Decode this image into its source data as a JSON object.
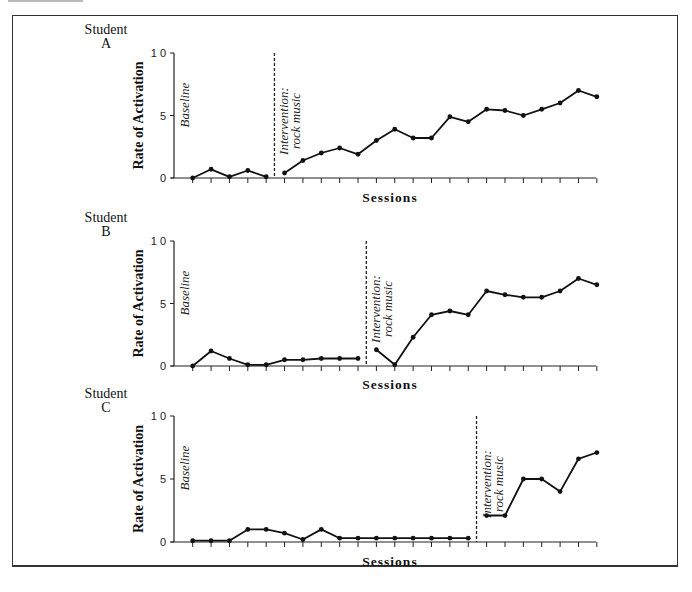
{
  "figure": {
    "x_axis_label": "Sessions",
    "y_axis_label": "Rate of Activation",
    "y_ticks": [
      "0",
      "5",
      "1 0"
    ],
    "phase_baseline": "Baseline",
    "phase_intervention_line1": "Intervention:",
    "phase_intervention_line2": "rock music"
  },
  "panels": [
    {
      "student_word": "Student",
      "student_id": "A"
    },
    {
      "student_word": "Student",
      "student_id": "B"
    },
    {
      "student_word": "Student",
      "student_id": "C"
    }
  ],
  "chart_data": [
    {
      "type": "line",
      "title": "Student A",
      "xlabel": "Sessions",
      "ylabel": "Rate of Activation",
      "ylim": [
        0,
        10
      ],
      "yticks": [
        0,
        5,
        10
      ],
      "grid": false,
      "x": [
        1,
        2,
        3,
        4,
        5,
        6,
        7,
        8,
        9,
        10,
        11,
        12,
        13,
        14,
        15,
        16,
        17,
        18,
        19,
        20,
        21,
        22,
        23
      ],
      "phase_change_after_session": 5,
      "series": [
        {
          "name": "Baseline",
          "x": [
            1,
            2,
            3,
            4,
            5
          ],
          "values": [
            0,
            0.7,
            0.1,
            0.6,
            0.1
          ]
        },
        {
          "name": "Intervention: rock music",
          "x": [
            6,
            7,
            8,
            9,
            10,
            11,
            12,
            13,
            14,
            15,
            16,
            17,
            18,
            19,
            20,
            21,
            22,
            23
          ],
          "values": [
            0.4,
            1.4,
            2.0,
            2.4,
            1.9,
            3.0,
            3.9,
            3.2,
            3.2,
            4.9,
            4.5,
            5.5,
            5.4,
            5.0,
            5.5,
            6.0,
            7.0,
            6.5
          ]
        }
      ]
    },
    {
      "type": "line",
      "title": "Student B",
      "xlabel": "Sessions",
      "ylabel": "Rate of Activation",
      "ylim": [
        0,
        10
      ],
      "yticks": [
        0,
        5,
        10
      ],
      "grid": false,
      "x": [
        1,
        2,
        3,
        4,
        5,
        6,
        7,
        8,
        9,
        10,
        11,
        12,
        13,
        14,
        15,
        16,
        17,
        18,
        19,
        20,
        21,
        22,
        23
      ],
      "phase_change_after_session": 10,
      "series": [
        {
          "name": "Baseline",
          "x": [
            1,
            2,
            3,
            4,
            5,
            6,
            7,
            8,
            9,
            10
          ],
          "values": [
            0,
            1.2,
            0.6,
            0.1,
            0.1,
            0.5,
            0.5,
            0.6,
            0.6,
            0.6
          ]
        },
        {
          "name": "Intervention: rock music",
          "x": [
            11,
            12,
            13,
            14,
            15,
            16,
            17,
            18,
            19,
            20,
            21,
            22,
            23
          ],
          "values": [
            1.3,
            0.1,
            2.3,
            4.1,
            4.4,
            4.1,
            6.0,
            5.7,
            5.5,
            5.5,
            6.0,
            7.0,
            6.5
          ]
        }
      ]
    },
    {
      "type": "line",
      "title": "Student C",
      "xlabel": "Sessions",
      "ylabel": "Rate of Activation",
      "ylim": [
        0,
        10
      ],
      "yticks": [
        0,
        5,
        10
      ],
      "grid": false,
      "x": [
        1,
        2,
        3,
        4,
        5,
        6,
        7,
        8,
        9,
        10,
        11,
        12,
        13,
        14,
        15,
        16,
        17,
        18,
        19,
        20,
        21,
        22,
        23
      ],
      "phase_change_after_session": 16,
      "series": [
        {
          "name": "Baseline",
          "x": [
            1,
            2,
            3,
            4,
            5,
            6,
            7,
            8,
            9,
            10,
            11,
            12,
            13,
            14,
            15,
            16
          ],
          "values": [
            0.1,
            0.1,
            0.1,
            1.0,
            1.0,
            0.7,
            0.2,
            1.0,
            0.3,
            0.3,
            0.3,
            0.3,
            0.3,
            0.3,
            0.3,
            0.3
          ]
        },
        {
          "name": "Intervention: rock music",
          "x": [
            17,
            18,
            19,
            20,
            21,
            22,
            23
          ],
          "values": [
            2.1,
            2.1,
            5.0,
            5.0,
            4.0,
            6.6,
            7.1
          ]
        }
      ]
    }
  ]
}
